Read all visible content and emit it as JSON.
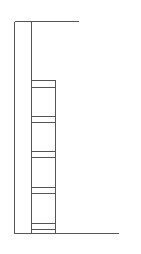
{
  "diagram": {
    "stroke_color": "#555555",
    "background": "#ffffff",
    "frame": {
      "left_x": 14,
      "inner_x": 31,
      "top_y": 21,
      "bottom_y": 233,
      "top_right_x": 78,
      "bottom_right_x": 118
    },
    "stack": {
      "left_x": 31,
      "right_x": 55,
      "top_y": 80,
      "bottom_y": 233,
      "shelf_pairs": [
        [
          80,
          87
        ],
        [
          116,
          122
        ],
        [
          151,
          157
        ],
        [
          187,
          193
        ],
        [
          223,
          229
        ]
      ]
    }
  }
}
